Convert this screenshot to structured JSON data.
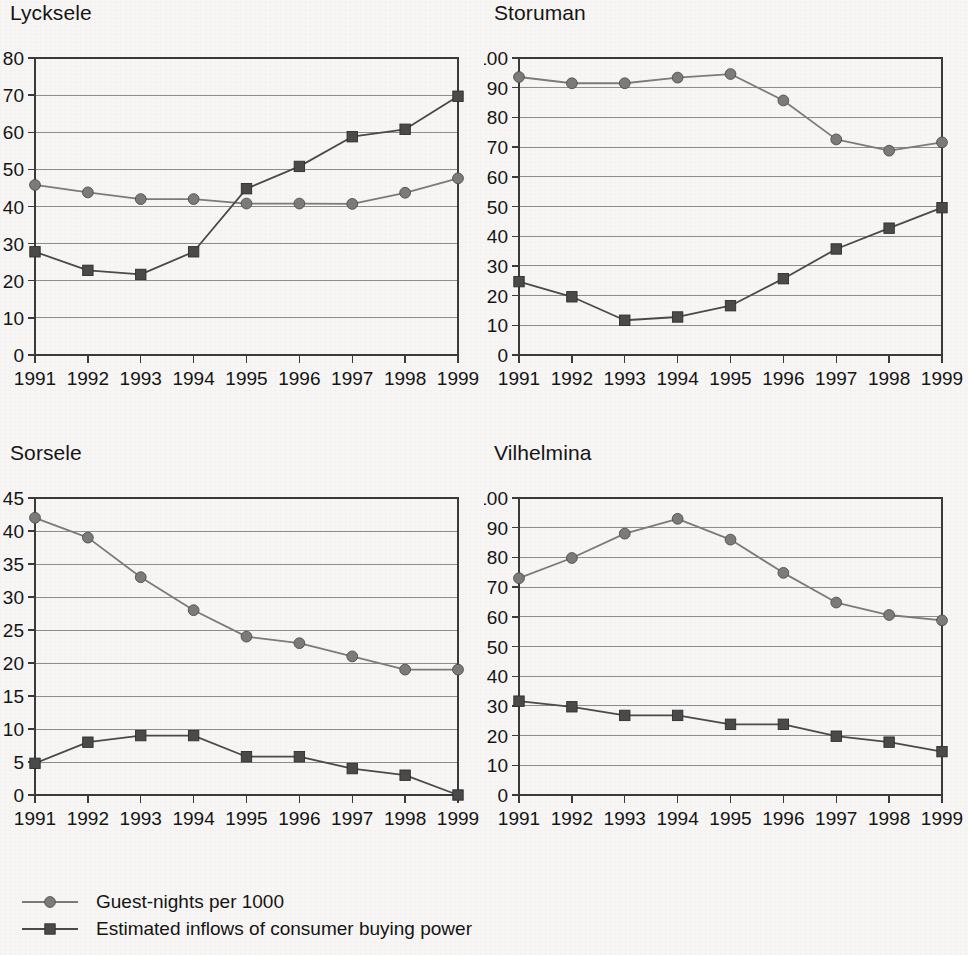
{
  "legend": {
    "entries": [
      {
        "label": "Guest-nights per 1000",
        "marker": "circle",
        "color": "#7b7b7b"
      },
      {
        "label": "Estimated inflows of consumer buying power",
        "marker": "square",
        "color": "#4a4a4a"
      }
    ]
  },
  "colors": {
    "circle_series": "#7b7b7b",
    "square_series": "#4a4a4a",
    "axis": "#3a3a3a",
    "grid": "#8d8d8d",
    "background": "#f7f6f4",
    "text": "#151515"
  },
  "chart_data": [
    {
      "type": "line",
      "title": "Lycksele",
      "xlabel": "",
      "ylabel": "",
      "x": [
        1991,
        1992,
        1993,
        1994,
        1995,
        1996,
        1997,
        1998,
        1999
      ],
      "categories": [
        "1991",
        "1992",
        "1993",
        "1994",
        "1995",
        "1996",
        "1997",
        "1998",
        "1999"
      ],
      "ylim": [
        0,
        80
      ],
      "yticks": [
        0,
        10,
        20,
        30,
        40,
        50,
        60,
        70,
        80
      ],
      "grid": true,
      "legend_position": "below-figure",
      "series": [
        {
          "name": "Guest-nights per 1000",
          "marker": "circle",
          "values": [
            45.8,
            43.8,
            42.0,
            42.0,
            40.8,
            40.8,
            40.7,
            43.7,
            47.6
          ]
        },
        {
          "name": "Estimated inflows of consumer buying power",
          "marker": "square",
          "values": [
            27.8,
            22.8,
            21.7,
            27.8,
            44.8,
            50.8,
            58.8,
            60.8,
            69.7
          ]
        }
      ]
    },
    {
      "type": "line",
      "title": "Storuman",
      "xlabel": "",
      "ylabel": "",
      "x": [
        1991,
        1992,
        1993,
        1994,
        1995,
        1996,
        1997,
        1998,
        1999
      ],
      "categories": [
        "1991",
        "1992",
        "1993",
        "1994",
        "1995",
        "1996",
        "1997",
        "1998",
        "1999"
      ],
      "ylim": [
        0,
        100
      ],
      "yticks": [
        0,
        10,
        20,
        30,
        40,
        50,
        60,
        70,
        80,
        90,
        100
      ],
      "grid": true,
      "legend_position": "below-figure",
      "series": [
        {
          "name": "Guest-nights per 1000",
          "marker": "circle",
          "values": [
            93.6,
            91.5,
            91.5,
            93.4,
            94.6,
            85.7,
            72.6,
            68.8,
            71.6
          ]
        },
        {
          "name": "Estimated inflows of consumer buying power",
          "marker": "square",
          "values": [
            24.7,
            19.6,
            11.7,
            12.8,
            16.6,
            25.7,
            35.7,
            42.7,
            49.6
          ]
        }
      ]
    },
    {
      "type": "line",
      "title": "Sorsele",
      "xlabel": "",
      "ylabel": "",
      "x": [
        1991,
        1992,
        1993,
        1994,
        1995,
        1996,
        1997,
        1998,
        1999
      ],
      "categories": [
        "1991",
        "1992",
        "1993",
        "1994",
        "1995",
        "1996",
        "1997",
        "1998",
        "1999"
      ],
      "ylim": [
        0,
        45
      ],
      "yticks": [
        0,
        5,
        10,
        15,
        20,
        25,
        30,
        35,
        40,
        45
      ],
      "grid": true,
      "legend_position": "below-figure",
      "series": [
        {
          "name": "Guest-nights per 1000",
          "marker": "circle",
          "values": [
            42.0,
            39.0,
            33.0,
            28.0,
            24.0,
            23.0,
            21.0,
            19.0,
            19.0
          ]
        },
        {
          "name": "Estimated inflows of consumer buying power",
          "marker": "square",
          "values": [
            4.8,
            8.0,
            9.0,
            9.0,
            5.8,
            5.8,
            4.0,
            3.0,
            0.0
          ]
        }
      ]
    },
    {
      "type": "line",
      "title": "Vilhelmina",
      "xlabel": "",
      "ylabel": "",
      "x": [
        1991,
        1992,
        1993,
        1994,
        1995,
        1996,
        1997,
        1998,
        1999
      ],
      "categories": [
        "1991",
        "1992",
        "1993",
        "1994",
        "1995",
        "1996",
        "1997",
        "1998",
        "1999"
      ],
      "ylim": [
        0,
        100
      ],
      "yticks": [
        0,
        10,
        20,
        30,
        40,
        50,
        60,
        70,
        80,
        90,
        100
      ],
      "grid": true,
      "legend_position": "below-figure",
      "series": [
        {
          "name": "Guest-nights per 1000",
          "marker": "circle",
          "values": [
            73.0,
            79.8,
            88.0,
            93.0,
            86.0,
            74.8,
            64.8,
            60.6,
            58.8
          ]
        },
        {
          "name": "Estimated inflows of consumer buying power",
          "marker": "square",
          "values": [
            31.6,
            29.7,
            26.8,
            26.8,
            23.8,
            23.8,
            19.8,
            17.8,
            14.6
          ]
        }
      ]
    }
  ]
}
